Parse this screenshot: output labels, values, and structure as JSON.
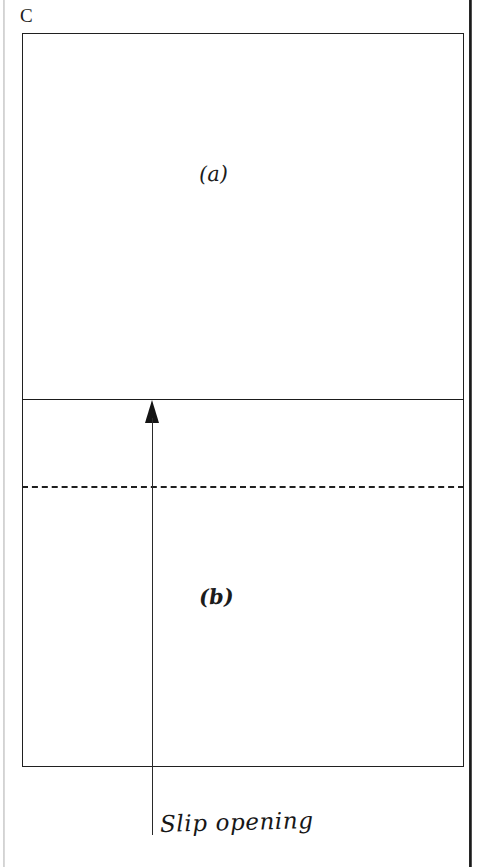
{
  "figure": {
    "panel_letter": "C",
    "regions": [
      {
        "id": "a",
        "label": "(a)"
      },
      {
        "id": "b",
        "label": "(b)"
      }
    ],
    "annotation": {
      "caption": "Slip opening",
      "arrow": "up-arrow-icon"
    }
  },
  "colors": {
    "ink": "#1c1c1c",
    "paper": "#ffffff",
    "scan_edge": "#1a1a1a"
  }
}
